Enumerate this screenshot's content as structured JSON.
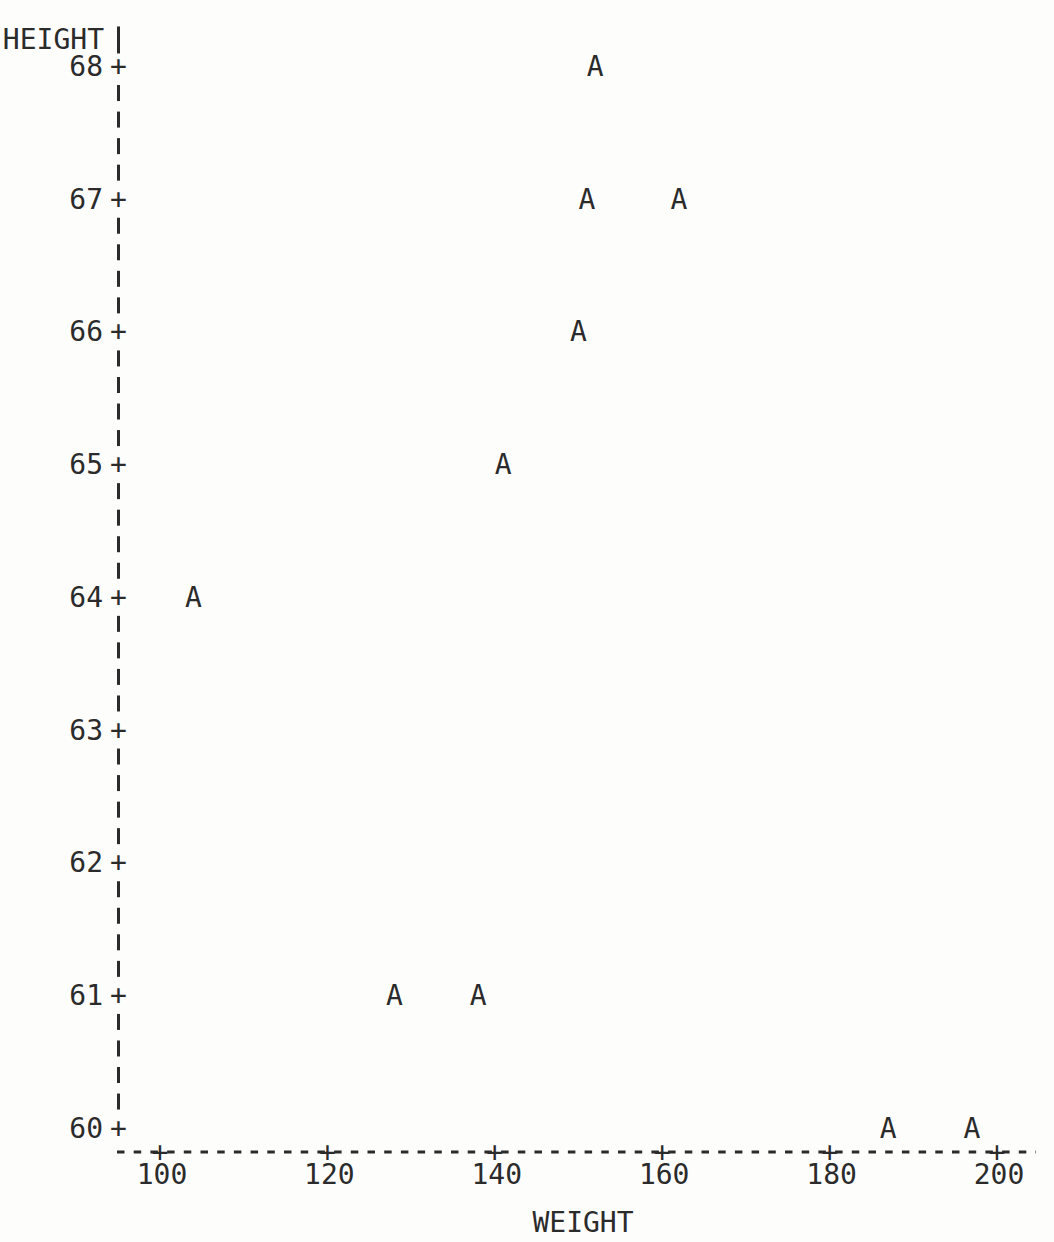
{
  "page": {
    "background_color": "#fdfdfc",
    "ink_color": "#2b2b2b"
  },
  "chart_data": {
    "type": "scatter",
    "plot_style": "line-printer-character-plot",
    "title": "",
    "xlabel": "WEIGHT",
    "ylabel": "HEIGHT",
    "marker_glyph": "A",
    "x_ticks": [
      100,
      120,
      140,
      160,
      180,
      200
    ],
    "y_ticks": [
      68,
      67,
      66,
      65,
      64,
      63,
      62,
      61,
      60
    ],
    "xlim": [
      95,
      205
    ],
    "ylim": [
      60,
      68
    ],
    "grid": "off",
    "legend": "none",
    "points": [
      {
        "weight": 152,
        "height": 68
      },
      {
        "weight": 151,
        "height": 67
      },
      {
        "weight": 162,
        "height": 67
      },
      {
        "weight": 150,
        "height": 66
      },
      {
        "weight": 141,
        "height": 65
      },
      {
        "weight": 104,
        "height": 64
      },
      {
        "weight": 128,
        "height": 61
      },
      {
        "weight": 138,
        "height": 61
      },
      {
        "weight": 187,
        "height": 60
      },
      {
        "weight": 197,
        "height": 60
      }
    ]
  }
}
